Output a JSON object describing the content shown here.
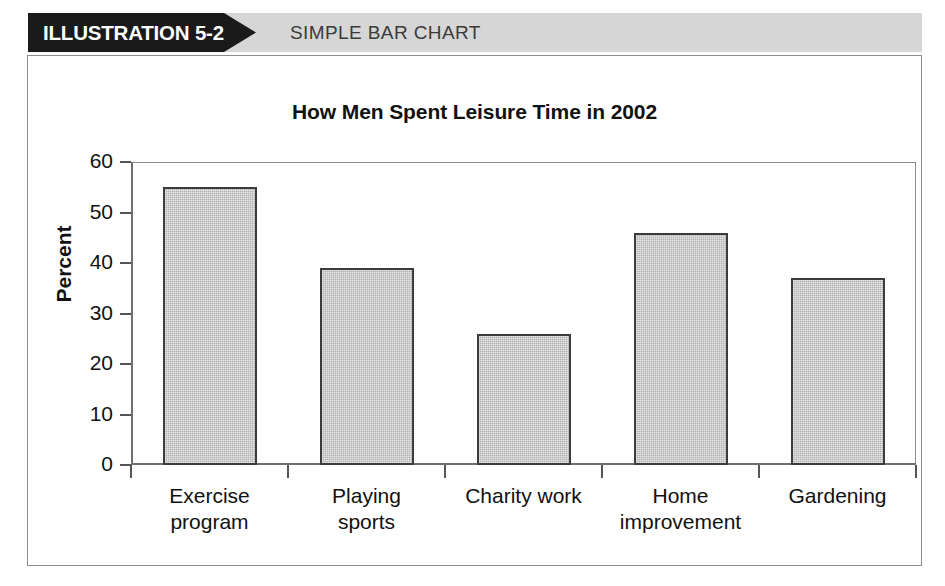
{
  "header": {
    "illustration_label": "ILLUSTRATION 5-2",
    "figure_type": "SIMPLE BAR CHART",
    "pennant_color": "#1a1a1a",
    "band_color": "#d6d6d6"
  },
  "chart_data": {
    "type": "bar",
    "title": "How Men Spent Leisure Time in 2002",
    "xlabel": "",
    "ylabel": "Percent",
    "categories": [
      "Exercise\nprogram",
      "Playing\nsports",
      "Charity work",
      "Home\nimprovement",
      "Gardening"
    ],
    "values": [
      55,
      39,
      26,
      46,
      37
    ],
    "ylim": [
      0,
      60
    ],
    "yticks": [
      0,
      10,
      20,
      30,
      40,
      50,
      60
    ],
    "ytick_labels": [
      "0",
      "10",
      "20",
      "30",
      "40",
      "50",
      "60"
    ],
    "grid": false,
    "legend": false,
    "bar_fill_color": "#b3b3b3",
    "bar_border_color": "#3c3c3c",
    "axis_color": "#6f6f6f"
  }
}
